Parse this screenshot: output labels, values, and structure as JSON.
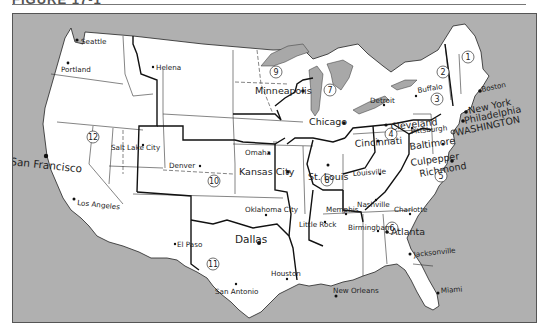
{
  "header": {
    "title": "FIGURE 17-1"
  },
  "map": {
    "colors": {
      "background": "#b0b0b0",
      "land": "#ffffff",
      "lakes": "#a8a8a8",
      "borders": "#111111"
    },
    "districts": [
      {
        "id": "1",
        "number": "1",
        "x": 345,
        "y": 70
      },
      {
        "id": "2",
        "number": "2",
        "x": 440,
        "y": 71
      },
      {
        "id": "3",
        "number": "3",
        "x": 436,
        "y": 120
      },
      {
        "id": "4",
        "number": "4",
        "x": 409,
        "y": 128
      },
      {
        "id": "5",
        "number": "5",
        "x": 438,
        "y": 168
      },
      {
        "id": "6",
        "number": "6",
        "x": 392,
        "y": 255
      },
      {
        "id": "7",
        "number": "7",
        "x": 314,
        "y": 109
      },
      {
        "id": "8",
        "number": "8",
        "x": 313,
        "y": 181
      },
      {
        "id": "9",
        "number": "9",
        "x": 262,
        "y": 59
      },
      {
        "id": "10",
        "number": "10",
        "x": 229,
        "y": 155
      },
      {
        "id": "11",
        "number": "11",
        "x": 223,
        "y": 259
      },
      {
        "id": "12",
        "number": "12",
        "x": 80,
        "y": 139
      }
    ],
    "cities": [
      {
        "name": "Seattle",
        "x": 76,
        "y": 42
      },
      {
        "name": "Portland",
        "x": 60,
        "y": 71
      },
      {
        "name": "Helena",
        "x": 152,
        "y": 69
      },
      {
        "name": "Minneapolis",
        "x": 242,
        "y": 94
      },
      {
        "name": "Chicago",
        "x": 307,
        "y": 124
      },
      {
        "name": "Detroit",
        "x": 356,
        "y": 108
      },
      {
        "name": "Buffalo",
        "x": 409,
        "y": 100
      },
      {
        "name": "Boston",
        "x": 480,
        "y": 83
      },
      {
        "name": "New York",
        "x": 461,
        "y": 110
      },
      {
        "name": "Philadelphia",
        "x": 455,
        "y": 121
      },
      {
        "name": "WASHINGTON",
        "x": 448,
        "y": 132
      },
      {
        "name": "Cleveland",
        "x": 378,
        "y": 129
      },
      {
        "name": "Pittsburgh",
        "x": 404,
        "y": 128
      },
      {
        "name": "Baltimore",
        "x": 398,
        "y": 145
      },
      {
        "name": "Cincinnati",
        "x": 343,
        "y": 147
      },
      {
        "name": "Culpepper",
        "x": 397,
        "y": 162
      },
      {
        "name": "Richmond",
        "x": 406,
        "y": 172
      },
      {
        "name": "Louisville",
        "x": 339,
        "y": 171
      },
      {
        "name": "Salt Lake City",
        "x": 106,
        "y": 138
      },
      {
        "name": "Denver",
        "x": 170,
        "y": 152
      },
      {
        "name": "Omaha",
        "x": 246,
        "y": 148
      },
      {
        "name": "Kansas City",
        "x": 237,
        "y": 162
      },
      {
        "name": "St. Louis",
        "x": 303,
        "y": 167
      },
      {
        "name": "San Francisco",
        "x": 8,
        "y": 151
      },
      {
        "name": "Los Angeles",
        "x": 64,
        "y": 203
      },
      {
        "name": "Oklahoma City",
        "x": 244,
        "y": 198
      },
      {
        "name": "Memphis",
        "x": 317,
        "y": 197
      },
      {
        "name": "Nashville",
        "x": 349,
        "y": 191
      },
      {
        "name": "Charlotte",
        "x": 385,
        "y": 184
      },
      {
        "name": "Little Rock",
        "x": 293,
        "y": 210
      },
      {
        "name": "Birmingham",
        "x": 337,
        "y": 216
      },
      {
        "name": "Atlanta",
        "x": 377,
        "y": 218
      },
      {
        "name": "Dallas",
        "x": 225,
        "y": 229
      },
      {
        "name": "El Paso",
        "x": 167,
        "y": 238
      },
      {
        "name": "San Antonio",
        "x": 210,
        "y": 285
      },
      {
        "name": "Houston",
        "x": 261,
        "y": 261
      },
      {
        "name": "New Orleans",
        "x": 321,
        "y": 276
      },
      {
        "name": "Jacksonville",
        "x": 413,
        "y": 245
      },
      {
        "name": "Miami",
        "x": 443,
        "y": 293
      }
    ]
  }
}
